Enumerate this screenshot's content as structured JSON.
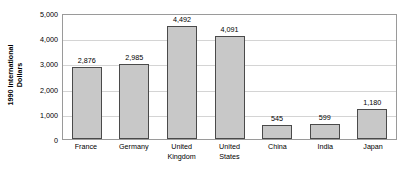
{
  "chart_data": {
    "type": "bar",
    "title": "",
    "xlabel": "",
    "ylabel": "1990 International\nDollars",
    "ylabel_lines": [
      "1990 International",
      "Dollars"
    ],
    "categories": [
      "France",
      "Germany",
      "United\nKingdom",
      "United\nStates",
      "China",
      "India",
      "Japan"
    ],
    "values": [
      2876,
      2985,
      4492,
      4091,
      545,
      599,
      1180
    ],
    "value_labels": [
      "2,876",
      "2,985",
      "4,492",
      "4,091",
      "545",
      "599",
      "1,180"
    ],
    "ylim": [
      0,
      5000
    ],
    "ytick_values": [
      0,
      1000,
      2000,
      3000,
      4000,
      5000
    ],
    "ytick_labels": [
      "0",
      "1,000",
      "2,000",
      "3,000",
      "4,000",
      "5,000"
    ],
    "grid": true,
    "grid_axis": "y",
    "legend": false,
    "legend_position": "none",
    "bar_fill_color": "#c8c8c8",
    "bar_border_color": "#4a4a4a",
    "gridline_color": "#d4d4d4",
    "frame_color": "#9a9a9a",
    "text_color": "#000000",
    "background_color": "#ffffff"
  }
}
